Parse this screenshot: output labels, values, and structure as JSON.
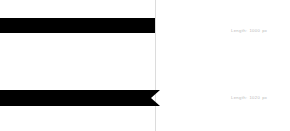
{
  "diagram": {
    "background_color": "#ffffff",
    "bar_color": "#000000",
    "label_color": "#b9b9b9",
    "guideline_color": "#dcdcdc",
    "guideline_x": 155,
    "bars": [
      {
        "id": "top-bar",
        "endcap": "flat",
        "x": 0,
        "y": 18,
        "width": 155,
        "height": 15,
        "notch_depth": 0,
        "label_prefix": "Length:",
        "label_value": "1000",
        "label_unit": "px",
        "label_text": "Length: 1000 px",
        "label_x": 231,
        "label_y": 29
      },
      {
        "id": "bottom-bar",
        "endcap": "notched",
        "x": 0,
        "y": 90,
        "width": 160,
        "height": 16,
        "notch_depth": 9,
        "label_prefix": "Length:",
        "label_value": "1020",
        "label_unit": "px",
        "label_text": "Length: 1020 px",
        "label_x": 231,
        "label_y": 96
      }
    ]
  }
}
